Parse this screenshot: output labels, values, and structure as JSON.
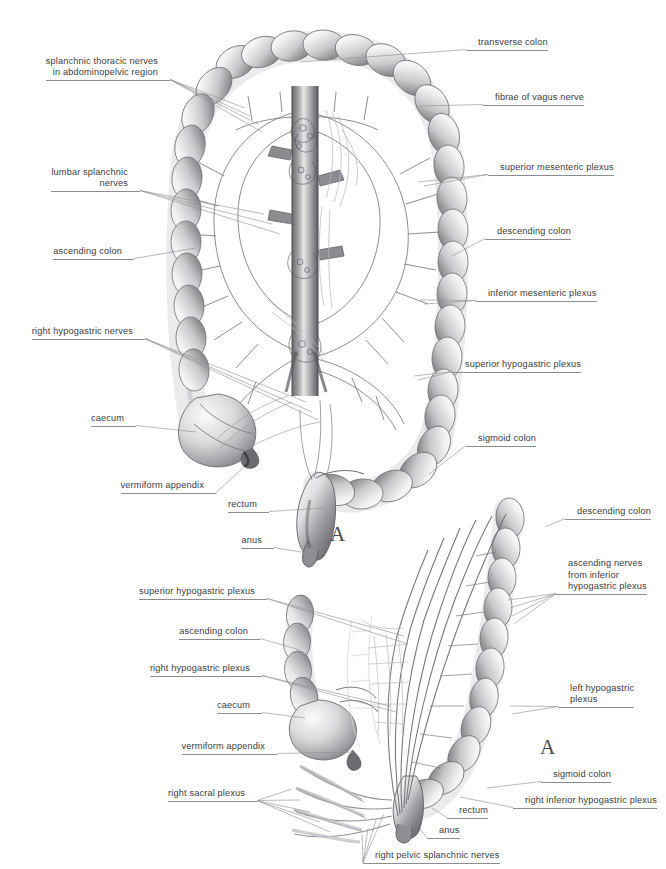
{
  "figure": {
    "style": "grayscale anatomical illustration",
    "background_color": "#ffffff",
    "label_text_color": "#3b3b40",
    "leader_line_color": "#8c8c93"
  },
  "panels": [
    {
      "id": "panel-top",
      "marker": "A",
      "marker_position": {
        "x": 336,
        "y": 524
      },
      "description": "Anterior view of entire colon with sympathetic and parasympathetic plexuses"
    },
    {
      "id": "panel-bottom",
      "marker": "A",
      "marker_position": {
        "x": 545,
        "y": 737
      },
      "description": "Lateral view of descending and sigmoid colon with hypogastric plexuses"
    }
  ],
  "labels": [
    {
      "id": "splanchnic-thoracic-nerves",
      "side": "left",
      "lines": [
        "splanchnic thoracic nerves",
        "in abdominopelvic region"
      ],
      "text": "splanchnic thoracic nerves in abdominopelvic region",
      "panel": "panel-top",
      "anchor": {
        "x": 158,
        "y": 79
      },
      "targets": [
        [
          245,
          108
        ],
        [
          250,
          116
        ],
        [
          258,
          124
        ],
        [
          262,
          132
        ]
      ]
    },
    {
      "id": "lumbar-splanchnic-nerves",
      "side": "left",
      "lines": [
        "lumbar splanchnic",
        "nerves"
      ],
      "text": "lumbar splanchnic nerves",
      "panel": "panel-top",
      "anchor": {
        "x": 128,
        "y": 190
      },
      "targets": [
        [
          264,
          214
        ],
        [
          272,
          224
        ],
        [
          280,
          234
        ]
      ]
    },
    {
      "id": "ascending-colon-top",
      "side": "left",
      "lines": [
        "ascending colon"
      ],
      "text": "ascending colon",
      "panel": "panel-top",
      "anchor": {
        "x": 122,
        "y": 258
      },
      "targets": [
        [
          196,
          248
        ]
      ]
    },
    {
      "id": "right-hypogastric-nerves",
      "side": "left",
      "lines": [
        "right hypogastric nerves"
      ],
      "text": "right hypogastric nerves",
      "panel": "panel-top",
      "anchor": {
        "x": 133,
        "y": 338
      },
      "targets": [
        [
          306,
          402
        ],
        [
          312,
          412
        ],
        [
          318,
          420
        ]
      ]
    },
    {
      "id": "caecum-top",
      "side": "left",
      "lines": [
        "caecum"
      ],
      "text": "caecum",
      "panel": "panel-top",
      "anchor": {
        "x": 124,
        "y": 425
      },
      "targets": [
        [
          196,
          432
        ]
      ]
    },
    {
      "id": "vermiform-appendix-top",
      "side": "left",
      "lines": [
        "vermiform appendix"
      ],
      "text": "vermiform appendix",
      "panel": "panel-top",
      "anchor": {
        "x": 204,
        "y": 492
      },
      "targets": [
        [
          245,
          466
        ]
      ]
    },
    {
      "id": "rectum-top",
      "side": "left",
      "lines": [
        "rectum"
      ],
      "text": "rectum",
      "panel": "panel-top",
      "anchor": {
        "x": 257,
        "y": 511
      },
      "targets": [
        [
          323,
          508
        ]
      ]
    },
    {
      "id": "anus-top",
      "side": "left",
      "lines": [
        "anus"
      ],
      "text": "anus",
      "panel": "panel-top",
      "anchor": {
        "x": 262,
        "y": 547
      },
      "targets": [
        [
          307,
          553
        ]
      ]
    },
    {
      "id": "transverse-colon",
      "side": "right",
      "lines": [
        "transverse colon"
      ],
      "text": "transverse colon",
      "panel": "panel-top",
      "anchor": {
        "x": 478,
        "y": 49
      },
      "targets": [
        [
          300,
          62
        ]
      ]
    },
    {
      "id": "fibrae-of-vagus-nerve",
      "side": "right",
      "lines": [
        "fibrae of vagus nerve"
      ],
      "text": "fibrae of vagus nerve",
      "panel": "panel-top",
      "anchor": {
        "x": 495,
        "y": 104
      },
      "targets": [
        [
          420,
          106
        ]
      ]
    },
    {
      "id": "superior-mesenteric-plexus",
      "side": "right",
      "lines": [
        "superior mesenteric plexus"
      ],
      "text": "superior mesenteric plexus",
      "panel": "panel-top",
      "anchor": {
        "x": 500,
        "y": 174
      },
      "targets": [
        [
          418,
          182
        ],
        [
          424,
          186
        ]
      ]
    },
    {
      "id": "descending-colon-top",
      "side": "right",
      "lines": [
        "descending colon"
      ],
      "text": "descending colon",
      "panel": "panel-top",
      "anchor": {
        "x": 497,
        "y": 238
      },
      "targets": [
        [
          452,
          256
        ]
      ]
    },
    {
      "id": "inferior-mesenteric-plexus",
      "side": "right",
      "lines": [
        "inferior mesenteric plexus"
      ],
      "text": "inferior mesenteric plexus",
      "panel": "panel-top",
      "anchor": {
        "x": 488,
        "y": 300
      },
      "targets": [
        [
          420,
          300
        ],
        [
          424,
          304
        ]
      ]
    },
    {
      "id": "superior-hypogastric-plexus-top",
      "side": "right",
      "lines": [
        "superior hypogastric plexus"
      ],
      "text": "superior hypogastric plexus",
      "panel": "panel-top",
      "anchor": {
        "x": 465,
        "y": 371
      },
      "targets": [
        [
          414,
          376
        ],
        [
          418,
          380
        ]
      ]
    },
    {
      "id": "sigmoid-colon-top",
      "side": "right",
      "lines": [
        "sigmoid colon"
      ],
      "text": "sigmoid colon",
      "panel": "panel-top",
      "anchor": {
        "x": 478,
        "y": 445
      },
      "targets": [
        [
          429,
          474
        ]
      ]
    },
    {
      "id": "descending-colon-bottom",
      "side": "right",
      "lines": [
        "descending colon"
      ],
      "text": "descending colon",
      "panel": "panel-bottom",
      "anchor": {
        "x": 577,
        "y": 518
      },
      "targets": [
        [
          545,
          527
        ]
      ]
    },
    {
      "id": "ascending-nerves-from-inferior-hypogastric-plexus",
      "side": "right",
      "lines": [
        "ascending nerves",
        "from inferior",
        "hypogastric plexus"
      ],
      "text": "ascending nerves from inferior hypogastric plexus",
      "panel": "panel-bottom",
      "anchor": {
        "x": 568,
        "y": 593
      },
      "targets": [
        [
          508,
          600
        ],
        [
          510,
          608
        ],
        [
          512,
          616
        ],
        [
          514,
          624
        ]
      ]
    },
    {
      "id": "left-hypogastric-plexus",
      "side": "right",
      "lines": [
        "left hypogastric",
        "plexus"
      ],
      "text": "left hypogastric plexus",
      "panel": "panel-bottom",
      "anchor": {
        "x": 570,
        "y": 706
      },
      "targets": [
        [
          510,
          706
        ],
        [
          512,
          714
        ]
      ]
    },
    {
      "id": "sigmoid-colon-bottom",
      "side": "right",
      "lines": [
        "sigmoid colon"
      ],
      "text": "sigmoid colon",
      "panel": "panel-bottom",
      "anchor": {
        "x": 553,
        "y": 781
      },
      "targets": [
        [
          487,
          788
        ]
      ]
    },
    {
      "id": "right-inferior-hypogastric-plexus",
      "side": "right",
      "lines": [
        "right inferior hypogastric plexus"
      ],
      "text": "right inferior hypogastric plexus",
      "panel": "panel-bottom",
      "anchor": {
        "x": 525,
        "y": 807
      },
      "targets": [
        [
          460,
          797
        ]
      ]
    },
    {
      "id": "rectum-bottom",
      "side": "right",
      "lines": [
        "rectum"
      ],
      "text": "rectum",
      "panel": "panel-bottom",
      "anchor": {
        "x": 459,
        "y": 817
      },
      "targets": [
        [
          432,
          808
        ]
      ]
    },
    {
      "id": "anus-bottom",
      "side": "right",
      "lines": [
        "anus"
      ],
      "text": "anus",
      "panel": "panel-bottom",
      "anchor": {
        "x": 439,
        "y": 837
      },
      "targets": [
        [
          420,
          829
        ]
      ]
    },
    {
      "id": "superior-hypogastric-plexus-bottom",
      "side": "left",
      "lines": [
        "superior hypogastric plexus"
      ],
      "text": "superior hypogastric plexus",
      "panel": "panel-bottom",
      "anchor": {
        "x": 255,
        "y": 598
      },
      "targets": [
        [
          404,
          636
        ],
        [
          408,
          644
        ]
      ]
    },
    {
      "id": "ascending-colon-bottom",
      "side": "left",
      "lines": [
        "ascending colon"
      ],
      "text": "ascending colon",
      "panel": "panel-bottom",
      "anchor": {
        "x": 248,
        "y": 638
      },
      "targets": [
        [
          300,
          650
        ]
      ]
    },
    {
      "id": "right-hypogastric-plexus",
      "side": "left",
      "lines": [
        "right hypogastric plexus"
      ],
      "text": "right hypogastric plexus",
      "panel": "panel-bottom",
      "anchor": {
        "x": 250,
        "y": 675
      },
      "targets": [
        [
          390,
          706
        ],
        [
          396,
          712
        ]
      ]
    },
    {
      "id": "caecum-bottom",
      "side": "left",
      "lines": [
        "caecum"
      ],
      "text": "caecum",
      "panel": "panel-bottom",
      "anchor": {
        "x": 250,
        "y": 712
      },
      "targets": [
        [
          305,
          718
        ]
      ]
    },
    {
      "id": "vermiform-appendix-bottom",
      "side": "left",
      "lines": [
        "vermiform appendix"
      ],
      "text": "vermiform appendix",
      "panel": "panel-bottom",
      "anchor": {
        "x": 265,
        "y": 753
      },
      "targets": [
        [
          355,
          752
        ]
      ]
    },
    {
      "id": "right-sacral-plexus",
      "side": "left",
      "lines": [
        "right sacral plexus"
      ],
      "text": "right sacral plexus",
      "panel": "panel-bottom",
      "anchor": {
        "x": 245,
        "y": 800
      },
      "targets": [
        [
          292,
          789
        ],
        [
          300,
          800
        ],
        [
          310,
          812
        ],
        [
          320,
          822
        ],
        [
          330,
          832
        ]
      ]
    },
    {
      "id": "right-pelvic-splanchnic-nerves",
      "side": "right",
      "lines": [
        "right pelvic splanchnic nerves"
      ],
      "text": "right pelvic splanchnic nerves",
      "panel": "panel-bottom",
      "anchor": {
        "x": 375,
        "y": 862
      },
      "targets": [
        [
          362,
          834
        ],
        [
          368,
          828
        ],
        [
          376,
          820
        ],
        [
          384,
          814
        ]
      ]
    }
  ]
}
